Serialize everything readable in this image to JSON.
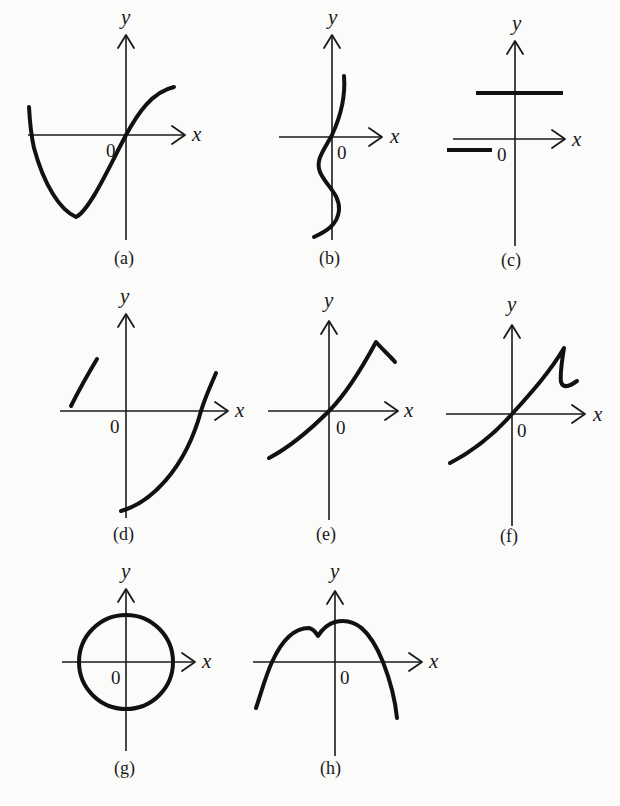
{
  "figure": {
    "colors": {
      "background": "#fbfbf9",
      "ink": "#111111"
    },
    "panels": [
      {
        "id": "a",
        "caption": "(a)",
        "x_label": "x",
        "y_label": "y",
        "origin_label": "0",
        "shape": "cubic-like curve: starts high at left, dips to a minimum, rises through origin, levels off at right"
      },
      {
        "id": "b",
        "caption": "(b)",
        "x_label": "x",
        "y_label": "y",
        "origin_label": "0",
        "shape": "S-shaped curve winding vertically along the y-axis"
      },
      {
        "id": "c",
        "caption": "(c)",
        "x_label": "x",
        "y_label": "y",
        "origin_label": "0",
        "shape": "two horizontal segments: one above x-axis crossing y-axis, one below x-axis on the left"
      },
      {
        "id": "d",
        "caption": "(d)",
        "x_label": "x",
        "y_label": "y",
        "origin_label": "0",
        "shape": "short rising segment at upper-left, and a parabola-like arc from bottom of y-axis rising through the positive x-axis"
      },
      {
        "id": "e",
        "caption": "(e)",
        "x_label": "x",
        "y_label": "y",
        "origin_label": "0",
        "shape": "increasing curve through origin ending in a sharp cusp that turns downward"
      },
      {
        "id": "f",
        "caption": "(f)",
        "x_label": "x",
        "y_label": "y",
        "origin_label": "0",
        "shape": "increasing curve through origin, sharp peak, vertical drop, then short hook to the right"
      },
      {
        "id": "g",
        "caption": "(g)",
        "x_label": "x",
        "y_label": "y",
        "origin_label": "0",
        "shape": "circle centered at origin"
      },
      {
        "id": "h",
        "caption": "(h)",
        "x_label": "x",
        "y_label": "y",
        "origin_label": "0",
        "shape": "downward-opening arch with a small notch/dip left of the y-axis"
      }
    ]
  }
}
